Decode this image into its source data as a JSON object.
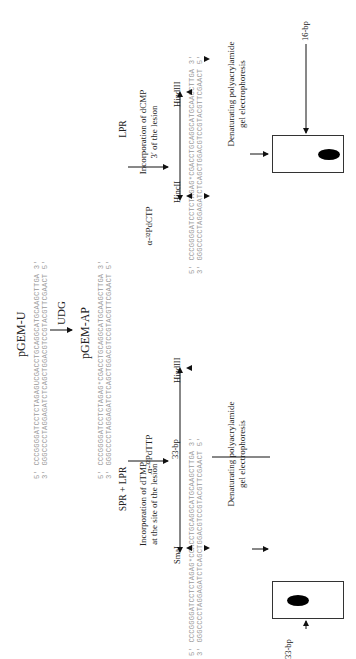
{
  "top": {
    "title": "pGEM-U",
    "seq_top": "5′ CCCGGGGATCCTCTAGAGUCGACCTGCAGGCATGCAAGCTTGA 3′",
    "seq_bottom": "3′ GGGCCCCTAGGAGATCTCAGCTGGACGTCCGTACGTTCGAACT 5′",
    "enzyme": "UDG",
    "product_title": "pGEM-AP",
    "ap_seq_top": "5′ CCCGGGGATCCTCTAGAG*CGACCTGCAGGCATGCAAGCTTGA 3′",
    "ap_seq_bottom": "3′ GGGCCCCTAGGAGATCTCAGCTGGACGTCCGTACGTTCGAACT 5′"
  },
  "left_branch": {
    "process": "SPR + LPR",
    "description_line1": "Incorporation of dTMP",
    "description_line2": "at the site of the lesion",
    "label_nucleotide": "α-³²PdTTP",
    "enzyme_left": "SmaI",
    "enzyme_right": "HindIII",
    "fragment_label": "33-bp",
    "seq_top": "5′ CCCGGGGATCCTCTAGAG*CGACCTGCAGGCATGCAAGCTTGA 3′",
    "seq_bottom": "3′ GGGCCCCTAGGAGATCTCAGCTGGACGTCCGTACGTTCGAACT 5′",
    "gel_title_line1": "Denaturating polyacrylamide",
    "gel_title_line2": "gel electrophoresis",
    "band_label": "33-bp"
  },
  "right_branch": {
    "process": "LPR",
    "description_line1": "Incorporation of dCMP",
    "description_line2": "3′ of the lesion",
    "label_nucleotide": "α-³²PdCTP",
    "enzyme_left": "HincII",
    "enzyme_right": "HindIII",
    "seq_top": "5′ CCCGGGGATCCTCTAGAG*CGACCTGCAGGCATGCAAGCTTGA 3′",
    "seq_bottom": "3′ GGGCCCCTAGGAGATCTCAGCTGGACGTCCGTACGTTCGAACT 5′",
    "gel_title_line1": "Denaturating polyacrylamide",
    "gel_title_line2": "gel electrophoresis",
    "band_label": "16-bp"
  }
}
